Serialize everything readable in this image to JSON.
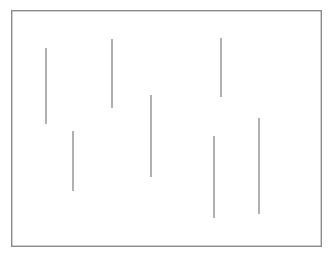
{
  "figure": {
    "canvas": {
      "width": 333,
      "height": 260,
      "background": "#ffffff"
    },
    "frame": {
      "name": "bounding-rectangle",
      "x": 11,
      "y": 10,
      "width": 311,
      "height": 237,
      "stroke": "#8a8a8a",
      "stroke_width": 1.4,
      "fill": "#ffffff"
    },
    "line_style": {
      "stroke": "#7d7d7d",
      "stroke_width": 1.2
    }
  },
  "chart_data": {
    "type": "scatter",
    "xlabel": "",
    "ylabel": "",
    "xlim": [
      11,
      322
    ],
    "ylim": [
      10,
      247
    ],
    "grid": false,
    "legend": false,
    "segment_count": 7,
    "segments": [
      {
        "id": "segment-1",
        "x": 46,
        "y_top": 48,
        "y_bottom": 124,
        "length": 76
      },
      {
        "id": "segment-2",
        "x": 73,
        "y_top": 131,
        "y_bottom": 191,
        "length": 60
      },
      {
        "id": "segment-3",
        "x": 112,
        "y_top": 39,
        "y_bottom": 108,
        "length": 69
      },
      {
        "id": "segment-4",
        "x": 151,
        "y_top": 95,
        "y_bottom": 177,
        "length": 82
      },
      {
        "id": "segment-5",
        "x": 221,
        "y_top": 38,
        "y_bottom": 97,
        "length": 59
      },
      {
        "id": "segment-6",
        "x": 214,
        "y_top": 136,
        "y_bottom": 218,
        "length": 82
      },
      {
        "id": "segment-7",
        "x": 259,
        "y_top": 118,
        "y_bottom": 214,
        "length": 96
      }
    ]
  },
  "artifacts": {
    "interior_smudge": "",
    "below_frame_smudge": ""
  }
}
